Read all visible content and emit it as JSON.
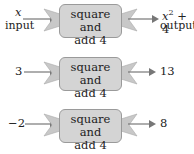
{
  "machine": {
    "label_line1": "square and",
    "label_line2": "add 4"
  },
  "rows": [
    {
      "input": "x",
      "input_caption": "input",
      "output_base": "x",
      "output_exp": "2",
      "output_rest": " + 4",
      "output_caption": "output"
    },
    {
      "input": "3",
      "output": "13"
    },
    {
      "input": "−2",
      "output": "8"
    }
  ],
  "colors": {
    "box_fill": "#d4d4d4",
    "box_border": "#9a9a9a",
    "funnel_fill": "#c8c8c8",
    "arrow": "#777777"
  }
}
